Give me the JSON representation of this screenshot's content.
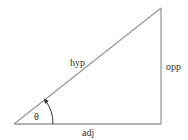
{
  "diagram": {
    "type": "right-triangle",
    "labels": {
      "hypotenuse": "hyp",
      "opposite": "opp",
      "adjacent": "adj",
      "angle": "θ"
    },
    "colors": {
      "stroke": "#999999",
      "text": "#333333",
      "background": "#ffffff"
    }
  }
}
